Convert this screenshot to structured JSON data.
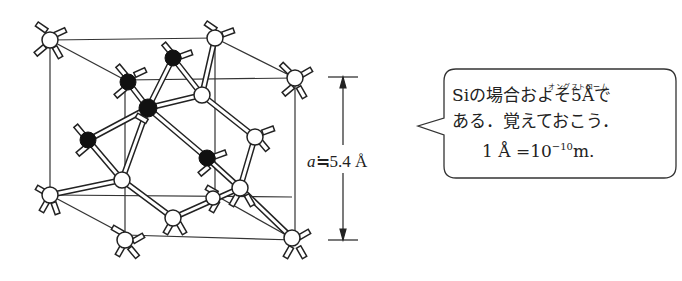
{
  "figure": {
    "dimension_label": {
      "symbol": "a",
      "relation": "≒",
      "value": "5.4 Å"
    }
  },
  "callout": {
    "ruby": "オングストローム",
    "line1": "Siの場合およそ5Åで",
    "line2": "ある．覚えておこう．",
    "line3_prefix": "1 Å =10",
    "line3_exp": "−10",
    "line3_suffix": "m."
  },
  "atoms": {
    "white_corner_face": 14,
    "black_interior": 4
  },
  "colors": {
    "line": "#222222",
    "white_atom": "#ffffff",
    "black_atom": "#111111"
  }
}
